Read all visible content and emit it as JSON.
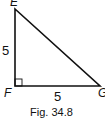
{
  "figure": {
    "caption": "Fig. 34.8",
    "vertices": {
      "top": "E",
      "right_angle": "F",
      "right": "G"
    },
    "sides": {
      "EF": "5",
      "FG": "5"
    },
    "right_angle_at": "F"
  }
}
